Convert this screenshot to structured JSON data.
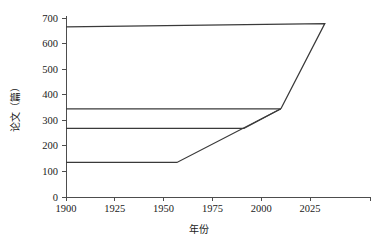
{
  "chart_data": {
    "type": "line",
    "title": "",
    "xlabel": "年份",
    "ylabel": "论文（篇）",
    "xlim": [
      1900,
      2032
    ],
    "ylim": [
      0,
      700
    ],
    "xticks": [
      1900,
      1925,
      1950,
      1975,
      2000,
      2025
    ],
    "xticklabels": [
      "1900",
      "1925",
      "1950",
      "1975",
      "2000",
      "2025"
    ],
    "yticks": [
      0,
      100,
      200,
      300,
      400,
      500,
      600,
      700
    ],
    "yticklabels": [
      "0",
      "100",
      "200",
      "300",
      "400",
      "500",
      "600",
      "700"
    ],
    "grid": false,
    "legend": null,
    "series": [
      {
        "name": "series-1-upper-envelope",
        "x": [
          1900,
          2012,
          1993
        ],
        "y": [
          665,
          678,
          345
        ]
      },
      {
        "name": "series-2-mid-upper",
        "x": [
          1900,
          1993
        ],
        "y": [
          345,
          345
        ]
      },
      {
        "name": "series-3-mid-lower",
        "x": [
          1900,
          1977,
          1993
        ],
        "y": [
          268,
          268,
          345
        ]
      },
      {
        "name": "series-4-lower",
        "x": [
          1900,
          1948,
          1993
        ],
        "y": [
          135,
          135,
          345
        ]
      }
    ]
  },
  "axes": {
    "y_axis_label": "论文（篇）",
    "x_axis_label": "年份"
  }
}
